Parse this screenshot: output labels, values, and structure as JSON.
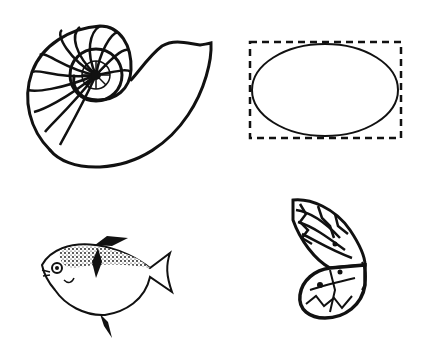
{
  "figures": [
    {
      "id": "nautilus",
      "label": "Nautilus shell",
      "icon": "nautilus-shell-icon"
    },
    {
      "id": "ellipse",
      "label": "Ellipse in dashed rectangle",
      "icon": "ellipse-icon"
    },
    {
      "id": "fish",
      "label": "Fish",
      "icon": "fish-icon"
    },
    {
      "id": "butterfly",
      "label": "Butterfly wing",
      "icon": "butterfly-icon"
    }
  ],
  "colors": {
    "ink": "#111111",
    "background": "#ffffff"
  }
}
